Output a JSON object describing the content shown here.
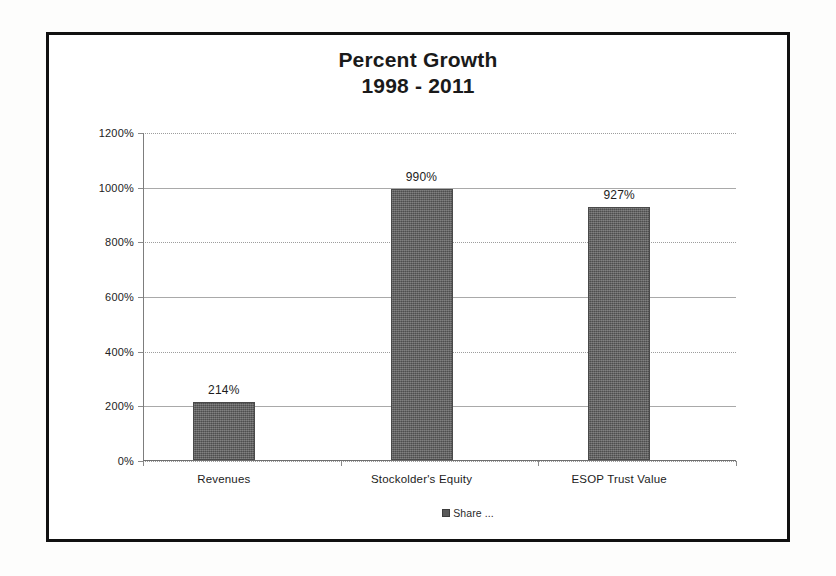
{
  "chart_data": {
    "type": "bar",
    "title": "Percent Growth",
    "subtitle": "1998 - 2011",
    "categories": [
      "Revenues",
      "Stockolder's Equity",
      "ESOP Trust Value"
    ],
    "values": [
      214,
      990,
      927
    ],
    "value_labels": [
      "214%",
      "990%",
      "927%"
    ],
    "series": [
      {
        "name": "Share ...",
        "values": [
          214,
          990,
          927
        ]
      }
    ],
    "xlabel": "",
    "ylabel": "",
    "ylim": [
      0,
      1200
    ],
    "ytick_values": [
      0,
      200,
      400,
      600,
      800,
      1000,
      1200
    ],
    "ytick_labels": [
      "0%",
      "200%",
      "400%",
      "600%",
      "800%",
      "1000%",
      "1200%"
    ],
    "grid": true,
    "legend_position": "bottom",
    "legend_entries": [
      "Share ..."
    ],
    "bar_color": "#5e5e5e",
    "gridline_color": "#9a9a9a",
    "text_color": "#1c1c1c",
    "frame_color": "#111111"
  },
  "legend": {
    "entry_label": "Share ..."
  }
}
